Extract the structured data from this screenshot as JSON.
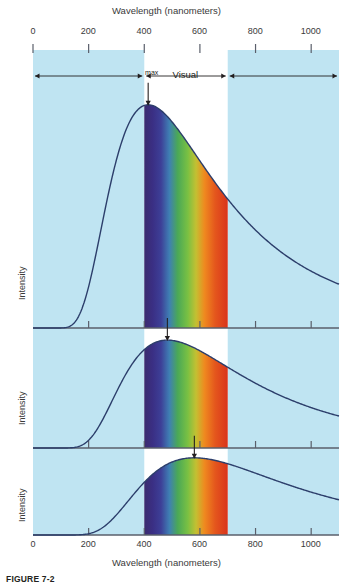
{
  "figure": {
    "caption": "FIGURE 7-2",
    "top_axis_title": "Wavelength (nanometers)",
    "bottom_axis_title": "Wavelength (nanometers)",
    "y_axis_label": "Intensity",
    "lambda_max_symbol": "λ",
    "lambda_max_sub": "max"
  },
  "axis": {
    "ticks": [
      0,
      200,
      400,
      600,
      800,
      1000
    ],
    "tick_labels": [
      "0",
      "200",
      "400",
      "600",
      "800",
      "1000"
    ],
    "xmin": 0,
    "xmax": 1100,
    "units": "nanometers"
  },
  "bands": [
    {
      "name": "Ultraviolet",
      "label": "Ultraviolet",
      "from": 0,
      "to": 400,
      "shaded": true,
      "color": "#bfe4f2"
    },
    {
      "name": "Visual",
      "label": "Visual",
      "from": 400,
      "to": 700,
      "shaded": false,
      "color": "#ffffff"
    },
    {
      "name": "Infrared",
      "label": "Infrared",
      "from": 700,
      "to": 1100,
      "shaded": true,
      "color": "#bfe4f2"
    }
  ],
  "colors": {
    "band_shade": "#bfe4f2",
    "curve": "#2c3e6b",
    "axis": "#5a5f6b",
    "text": "#231f20",
    "spectrum": [
      "#3b2b6e",
      "#3e2f86",
      "#3a4f9e",
      "#3f8fbf",
      "#4fae5a",
      "#7cc242",
      "#b9c738",
      "#e98b22",
      "#e4561f",
      "#d9341c"
    ]
  },
  "panels": [
    {
      "id": "panel-7000",
      "object_label": "Object at\n7000 K",
      "object_label_line1": "Object at",
      "object_label_line2": "7000 K",
      "temperature_label": "7000 K",
      "temperature_k": 7000,
      "lambda_max_nm": 414,
      "y_axis_label": "Intensity",
      "show_lambda_max": true
    },
    {
      "id": "panel-6000",
      "object_label_line1": "Object at",
      "object_label_line2": "6000 K",
      "temperature_label": "6000 K",
      "temperature_k": 6000,
      "lambda_max_nm": 483,
      "y_axis_label": "Intensity",
      "show_lambda_max": true
    },
    {
      "id": "panel-5000",
      "object_label_line1": "Object at",
      "object_label_line2": "5000 K",
      "temperature_label": "5000 K",
      "temperature_k": 5000,
      "lambda_max_nm": 580,
      "y_axis_label": "Intensity",
      "show_lambda_max": true
    }
  ],
  "chart_data": {
    "type": "line",
    "xlabel": "Wavelength (nanometers)",
    "ylabel": "Intensity",
    "xlim": [
      0,
      1100
    ],
    "grid": false,
    "legend": "inline-annotations",
    "x": [
      0,
      50,
      100,
      150,
      200,
      250,
      300,
      350,
      400,
      450,
      500,
      550,
      600,
      650,
      700,
      750,
      800,
      850,
      900,
      950,
      1000,
      1050,
      1100
    ],
    "series": [
      {
        "name": "7000 K",
        "peak_nm": 414,
        "values": [
          0,
          0,
          0.01,
          0.04,
          0.13,
          0.33,
          0.6,
          0.86,
          1.0,
          0.99,
          0.9,
          0.79,
          0.68,
          0.58,
          0.49,
          0.42,
          0.36,
          0.31,
          0.27,
          0.23,
          0.2,
          0.18,
          0.16
        ]
      },
      {
        "name": "6000 K",
        "peak_nm": 483,
        "values": [
          0,
          0,
          0.0,
          0.01,
          0.04,
          0.13,
          0.3,
          0.51,
          0.71,
          0.87,
          0.96,
          1.0,
          0.98,
          0.93,
          0.86,
          0.78,
          0.7,
          0.63,
          0.56,
          0.5,
          0.44,
          0.39,
          0.35
        ]
      },
      {
        "name": "5000 K",
        "peak_nm": 580,
        "values": [
          0,
          0,
          0.0,
          0.0,
          0.01,
          0.03,
          0.09,
          0.2,
          0.33,
          0.47,
          0.6,
          0.71,
          0.78,
          0.8,
          0.79,
          0.76,
          0.72,
          0.67,
          0.62,
          0.57,
          0.52,
          0.48,
          0.44
        ]
      }
    ]
  }
}
